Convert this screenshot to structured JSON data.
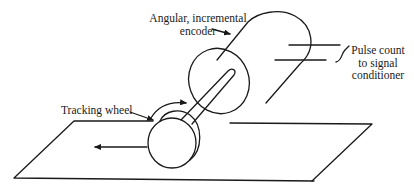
{
  "diagram": {
    "type": "mechanical-schematic",
    "labels": {
      "encoder": {
        "line1": "Angular, incremental",
        "line2": "encoder"
      },
      "pulse_output": {
        "line1": "Pulse count",
        "line2": "to signal",
        "line3": "conditioner"
      },
      "tracking_wheel": "Tracking wheel"
    },
    "components": [
      {
        "name": "encoder-body",
        "shape": "cylinder",
        "description": "Angular, incremental encoder"
      },
      {
        "name": "shaft",
        "shape": "rod",
        "description": "Shaft connecting tracking wheel to encoder"
      },
      {
        "name": "tracking-wheel",
        "shape": "disc",
        "description": "Tracking wheel"
      },
      {
        "name": "surface",
        "shape": "parallelogram",
        "description": "Moving surface plane"
      },
      {
        "name": "signal-wires",
        "shape": "two lines",
        "description": "Pulse count output leads"
      }
    ],
    "annotations": {
      "rotation_arrow": "curved arrow over wheel indicating rotation",
      "motion_arrow": "straight arrow pointing left indicating surface motion"
    },
    "colors": {
      "stroke": "#1a1a1a",
      "background": "#ffffff"
    }
  }
}
